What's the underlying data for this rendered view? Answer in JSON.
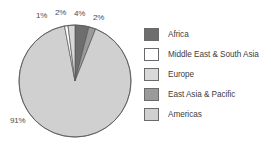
{
  "chart_data": {
    "type": "pie",
    "title": "",
    "labels": [
      "Africa",
      "Middle East & South Asia",
      "Europe",
      "East Asia & Pacific",
      "Americas"
    ],
    "values": [
      4,
      1,
      2,
      2,
      91
    ],
    "value_labels": [
      "4%",
      "1%",
      "2%",
      "2%",
      "91%"
    ],
    "colors": [
      "#6e6e6e",
      "#ffffff",
      "#d8d8d8",
      "#9a9a9a",
      "#d0d0d0"
    ],
    "slice_order_clockwise_from_top": [
      "Africa",
      "East Asia & Pacific",
      "Americas",
      "Middle East & South Asia",
      "Europe"
    ],
    "legend_position": "right",
    "grid": false,
    "outline_color": "#58585a"
  },
  "pie": {
    "callouts": [
      {
        "text": "1%",
        "left": 36,
        "top": 11
      },
      {
        "text": "2%",
        "left": 55,
        "top": 8
      },
      {
        "text": "4%",
        "left": 74,
        "top": 9
      },
      {
        "text": "2%",
        "left": 93,
        "top": 13
      },
      {
        "text": "91%",
        "left": 10,
        "top": 116
      }
    ]
  },
  "legend": {
    "entries": [
      {
        "label": "Africa",
        "color": "#6e6e6e"
      },
      {
        "label": "Middle East & South Asia",
        "color": "#ffffff"
      },
      {
        "label": "Europe",
        "color": "#d8d8d8"
      },
      {
        "label": "East Asia & Pacific",
        "color": "#9a9a9a"
      },
      {
        "label": "Americas",
        "color": "#d0d0d0"
      }
    ]
  }
}
